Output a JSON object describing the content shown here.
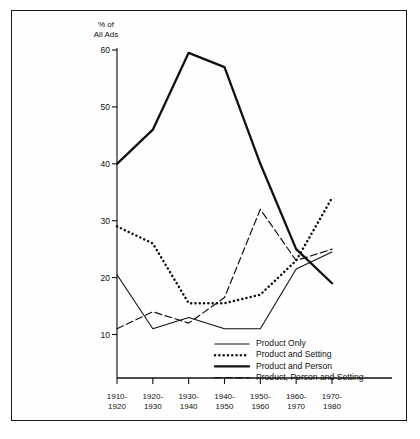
{
  "chart_data": {
    "type": "line",
    "title": "",
    "ylabel": "% of All Ads",
    "ylabel_line1": "% of",
    "ylabel_line2": "All Ads",
    "xlabel": "",
    "ylim": [
      5,
      60
    ],
    "yticks": [
      10,
      20,
      30,
      40,
      50,
      60
    ],
    "ytick_labels": [
      "10",
      "20",
      "30",
      "40",
      "50",
      "60"
    ],
    "grid": false,
    "legend_position": "bottom-center",
    "categories": [
      "1910-1920",
      "1920-1930",
      "1930-1940",
      "1940-1950",
      "1950-1960",
      "1960-1970",
      "1970-1980"
    ],
    "xtick_labels_top": [
      "1910-",
      "1920-",
      "1930-",
      "1940-",
      "1950-",
      "1960-",
      "1970-"
    ],
    "xtick_labels_bottom": [
      "1920",
      "1930",
      "1940",
      "1950",
      "1960",
      "1970",
      "1980"
    ],
    "series": [
      {
        "name": "Product Only",
        "style": "solid-thin",
        "color": "#111111",
        "values": [
          20.5,
          11.0,
          13.0,
          11.0,
          11.0,
          21.5,
          24.5
        ]
      },
      {
        "name": "Product and Setting",
        "style": "dotted",
        "color": "#111111",
        "values": [
          29.0,
          26.0,
          15.5,
          15.5,
          17.0,
          23.0,
          34.0
        ]
      },
      {
        "name": "Product and Person",
        "style": "solid-thick",
        "color": "#111111",
        "values": [
          40.0,
          46.0,
          59.5,
          57.0,
          40.0,
          25.0,
          19.0
        ]
      },
      {
        "name": "Product, Person and Setting",
        "style": "dashed",
        "color": "#111111",
        "values": [
          11.0,
          14.0,
          12.0,
          16.5,
          32.0,
          23.0,
          25.0
        ]
      }
    ]
  },
  "legend": {
    "items": [
      {
        "label": "Product Only",
        "style": "solid-thin"
      },
      {
        "label": "Product and Setting",
        "style": "dotted"
      },
      {
        "label": "Product and Person",
        "style": "solid-thick"
      },
      {
        "label": "Product, Person and Setting",
        "style": "dashed"
      }
    ]
  }
}
